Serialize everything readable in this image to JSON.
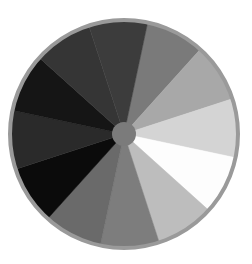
{
  "wheel": {
    "center": [
      124,
      134
    ],
    "radius": 113,
    "rim_color": "#9a9a9a",
    "rim_width": 4,
    "hub_radius": 12,
    "hub_color": "#7b7b7b",
    "start_angle_deg": 12,
    "segments": [
      {
        "name": "mid-gray",
        "color": "#7a7a7a",
        "sweep": 30
      },
      {
        "name": "light-gray",
        "color": "#a8a8a8",
        "sweep": 30
      },
      {
        "name": "very-light-gray",
        "color": "#d4d4d4",
        "sweep": 30
      },
      {
        "name": "white",
        "color": "#fdfdfd",
        "sweep": 30
      },
      {
        "name": "silver",
        "color": "#bdbdbd",
        "sweep": 30
      },
      {
        "name": "medium-gray",
        "color": "#7d7d7d",
        "sweep": 30
      },
      {
        "name": "dim-gray",
        "color": "#6a6a6a",
        "sweep": 30
      },
      {
        "name": "black",
        "color": "#0b0b0b",
        "sweep": 30
      },
      {
        "name": "near-black",
        "color": "#2a2a2a",
        "sweep": 30
      },
      {
        "name": "very-dark-gray",
        "color": "#151515",
        "sweep": 30
      },
      {
        "name": "charcoal",
        "color": "#353535",
        "sweep": 30
      },
      {
        "name": "dark-gray",
        "color": "#3c3c3c",
        "sweep": 30
      }
    ]
  }
}
